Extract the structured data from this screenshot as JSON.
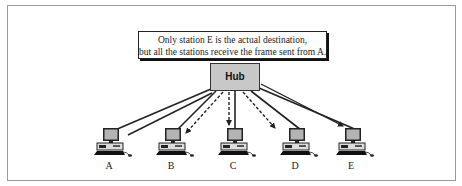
{
  "caption": {
    "line1": "Only station E is the actual destination,",
    "line2": "but all the stations receive the frame sent from A."
  },
  "hub": {
    "label": "Hub"
  },
  "stations": [
    {
      "id": "A",
      "label": "A",
      "role": "sender"
    },
    {
      "id": "B",
      "label": "B",
      "role": "receiver"
    },
    {
      "id": "C",
      "label": "C",
      "role": "receiver"
    },
    {
      "id": "D",
      "label": "D",
      "role": "receiver"
    },
    {
      "id": "E",
      "label": "E",
      "role": "destination"
    }
  ],
  "links": [
    {
      "from": "A",
      "to": "Hub",
      "style": "solid",
      "kind": "cable"
    },
    {
      "from": "B",
      "to": "Hub",
      "style": "solid",
      "kind": "cable"
    },
    {
      "from": "C",
      "to": "Hub",
      "style": "solid",
      "kind": "cable"
    },
    {
      "from": "D",
      "to": "Hub",
      "style": "solid",
      "kind": "cable"
    },
    {
      "from": "E",
      "to": "Hub",
      "style": "solid",
      "kind": "cable"
    }
  ],
  "flows": [
    {
      "from": "A",
      "to": "Hub",
      "style": "solid-line",
      "arrow": false
    },
    {
      "from": "Hub",
      "to": "B",
      "style": "dashed",
      "arrow": true
    },
    {
      "from": "Hub",
      "to": "C",
      "style": "dashed",
      "arrow": true
    },
    {
      "from": "Hub",
      "to": "D",
      "style": "dashed",
      "arrow": true
    },
    {
      "from": "Hub",
      "to": "E",
      "style": "solid-line",
      "arrow": true
    }
  ],
  "colors": {
    "hub_fill": "#c8c8c8",
    "monitor_fill": "#b4b4b4",
    "line": "#222222"
  }
}
